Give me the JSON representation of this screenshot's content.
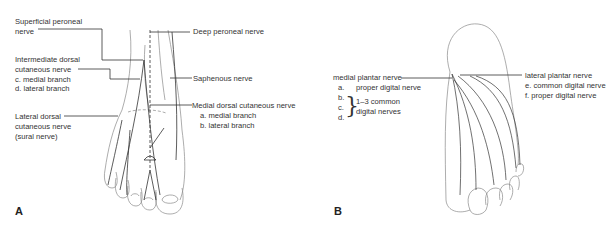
{
  "figure": {
    "panels": [
      {
        "letter": "A",
        "view": "dorsal foot",
        "labels": {
          "superficial_peroneal": [
            "Superficial peroneal",
            "nerve"
          ],
          "intermediate_dorsal": [
            "Intermediate dorsal",
            "cutaneous nerve",
            "c.  medial branch",
            "d.  lateral branch"
          ],
          "lateral_dorsal": [
            "Lateral dorsal",
            "cutaneous nerve",
            "(sural nerve)"
          ],
          "deep_peroneal": "Deep peroneal nerve",
          "saphenous": "Saphenous nerve",
          "medial_dorsal": [
            "Medial dorsal cutaneous nerve",
            "a.  medial branch",
            "b.  lateral branch"
          ]
        }
      },
      {
        "letter": "B",
        "view": "plantar foot",
        "labels": {
          "medial_plantar": "medial plantar nerve",
          "medial_items": [
            {
              "key": "a.",
              "text": "proper digital nerve"
            },
            {
              "key": "b.",
              "text": ""
            },
            {
              "key": "c.",
              "text": ""
            },
            {
              "key": "d.",
              "text": ""
            }
          ],
          "common_group": [
            "1–3 common",
            "digital nerves"
          ],
          "lateral_plantar": "lateral plantar nerve",
          "lateral_items": [
            {
              "key": "e.",
              "text": "common digital nerve"
            },
            {
              "key": "f.",
              "text": "proper digital nerve"
            }
          ]
        }
      }
    ],
    "colors": {
      "line": "#333333",
      "outline": "#888888",
      "background": "#ffffff"
    }
  }
}
